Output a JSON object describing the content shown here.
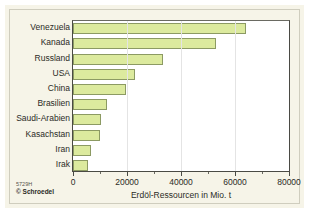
{
  "credit": {
    "code": "5729H",
    "publisher": "© Schroedel"
  },
  "colors": {
    "bar_fill": "#dcea9e",
    "bar_stroke": "#8c9a63",
    "panel_bg": "#f6f4e8",
    "plot_bg": "#ffffff",
    "axis": "#4a4a44",
    "gridline": "#e4e4e4"
  },
  "chart_data": {
    "type": "bar",
    "orientation": "horizontal",
    "title": "",
    "xlabel": "Erdöl-Ressourcen in Mio. t",
    "ylabel": "",
    "xlim": [
      0,
      80000
    ],
    "xticks": [
      0,
      20000,
      40000,
      60000,
      80000
    ],
    "xtick_labels": [
      "0",
      "20000",
      "40000",
      "60000",
      "80000"
    ],
    "grid": true,
    "legend": "none",
    "categories": [
      "Venezuela",
      "Kanada",
      "Russland",
      "USA",
      "China",
      "Brasilien",
      "Saudi-Arabien",
      "Kasachstan",
      "Iran",
      "Irak"
    ],
    "values": [
      64000,
      53000,
      33500,
      23000,
      19500,
      12500,
      10500,
      10000,
      6500,
      5500
    ],
    "units": "Mio. t"
  }
}
